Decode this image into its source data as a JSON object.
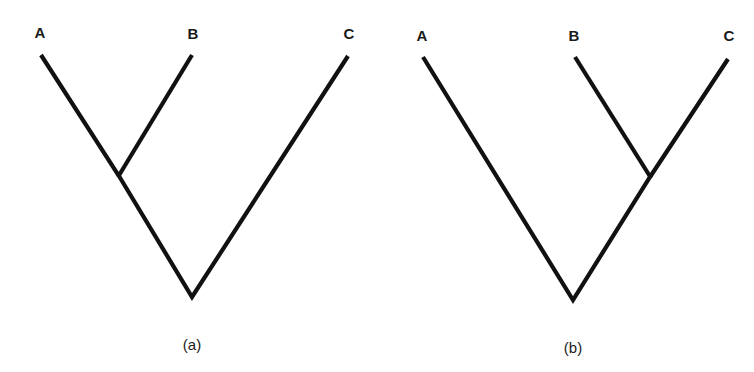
{
  "figure": {
    "panels": [
      {
        "id": "a",
        "caption": "(a)",
        "topology": "((A,B),C)",
        "labels": {
          "A": "A",
          "B": "B",
          "C": "C"
        }
      },
      {
        "id": "b",
        "caption": "(b)",
        "topology": "(A,(B,C))",
        "labels": {
          "A": "A",
          "B": "B",
          "C": "C"
        }
      }
    ]
  }
}
